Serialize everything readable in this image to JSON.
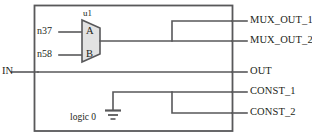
{
  "diagram": {
    "colors": {
      "wire": "#58585a",
      "outline": "#58585a",
      "mux_fill": "#e2e2e2",
      "text": "#231f20",
      "background": "#ffffff"
    },
    "instance": {
      "name": "u1",
      "type": "mux",
      "pins": [
        {
          "name": "A",
          "side": "left"
        },
        {
          "name": "B",
          "side": "left"
        }
      ]
    },
    "input_nets": [
      {
        "label": "n37",
        "to_pin": "A"
      },
      {
        "label": "n58",
        "to_pin": "B"
      }
    ],
    "primary_input": {
      "label": "IN"
    },
    "ground": {
      "label": "logic 0",
      "symbol": "ground-icon"
    },
    "output_ports": [
      {
        "label": "MUX_OUT_1",
        "source": "u1"
      },
      {
        "label": "MUX_OUT_2",
        "source": "u1"
      },
      {
        "label": "OUT",
        "source": "IN"
      },
      {
        "label": "CONST_1",
        "source": "logic 0"
      },
      {
        "label": "CONST_2",
        "source": "logic 0"
      }
    ]
  }
}
